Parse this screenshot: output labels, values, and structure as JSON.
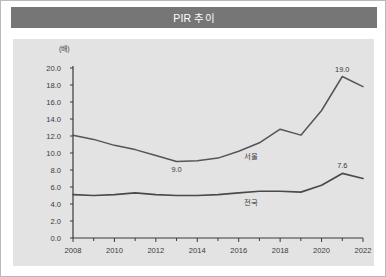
{
  "header": {
    "title": "PIR 추이"
  },
  "colors": {
    "title_bar": "#767676",
    "title_text": "#ffffff",
    "panel_bg": "#e3e3e3",
    "card_border": "#b9b9b9",
    "axis": "#3a3a3a",
    "series_seoul": "#555555",
    "series_nationwide": "#4a4a4a"
  },
  "chart_data": {
    "type": "line",
    "title": "PIR 추이",
    "unit_label": "(배)",
    "xlabel": "",
    "ylabel": "",
    "xlim": [
      2008,
      2022
    ],
    "ylim": [
      0.0,
      20.0
    ],
    "ytick_step": 2.0,
    "grid": false,
    "legend": "inline-labels",
    "x": [
      2008,
      2009,
      2010,
      2011,
      2012,
      2013,
      2014,
      2015,
      2016,
      2017,
      2018,
      2019,
      2020,
      2021,
      2022
    ],
    "xticks": [
      "2008",
      "2010",
      "2012",
      "2014",
      "2016",
      "2018",
      "2020",
      "2022"
    ],
    "xtick_values": [
      2008,
      2010,
      2012,
      2014,
      2016,
      2018,
      2020,
      2022
    ],
    "xminor_values": [
      2009,
      2011,
      2013,
      2015,
      2017,
      2019,
      2021
    ],
    "yticks": [
      "0.0",
      "2.0",
      "4.0",
      "6.0",
      "8.0",
      "10.0",
      "12.0",
      "14.0",
      "16.0",
      "18.0",
      "20.0"
    ],
    "ytick_values": [
      0.0,
      2.0,
      4.0,
      6.0,
      8.0,
      10.0,
      12.0,
      14.0,
      16.0,
      18.0,
      20.0
    ],
    "series": [
      {
        "name": "서울",
        "label": "서울",
        "label_at_x": 2016.6,
        "values": [
          12.1,
          11.6,
          10.9,
          10.4,
          9.7,
          9.0,
          9.1,
          9.4,
          10.2,
          11.2,
          12.8,
          12.1,
          15.0,
          19.0,
          17.8
        ],
        "data_labels": [
          {
            "x": 2013,
            "value": 9.0,
            "text": "9.0",
            "position": "below"
          },
          {
            "x": 2021,
            "value": 19.0,
            "text": "19.0",
            "position": "above"
          }
        ]
      },
      {
        "name": "전국",
        "label": "전국",
        "label_at_x": 2016.6,
        "values": [
          5.1,
          5.0,
          5.1,
          5.3,
          5.1,
          5.0,
          5.0,
          5.1,
          5.3,
          5.5,
          5.5,
          5.4,
          6.2,
          7.6,
          7.0
        ],
        "data_labels": [
          {
            "x": 2021,
            "value": 7.6,
            "text": "7.6",
            "position": "above"
          }
        ]
      }
    ]
  }
}
